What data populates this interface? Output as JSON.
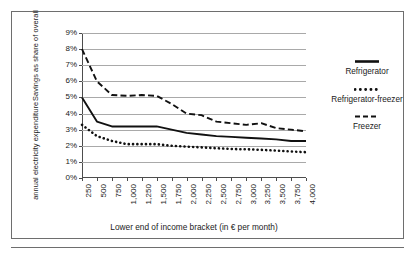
{
  "chart_data": {
    "type": "line",
    "title": "",
    "xlabel": "Lower end of income bracket (in € per month)",
    "ylabel": "Savings as share of overall annual electricity expenditure",
    "ylabel_lines": [
      "Savings as share of overall",
      "annual electricity expenditure"
    ],
    "categories": [
      "250",
      "500",
      "750",
      "1,000",
      "1,250",
      "1,500",
      "1,750",
      "2,000",
      "2,250",
      "2,500",
      "2,750",
      "3,000",
      "3,250",
      "3,500",
      "3,750",
      "4,000"
    ],
    "ytick_labels": [
      "0%",
      "1%",
      "2%",
      "3%",
      "4%",
      "5%",
      "6%",
      "7%",
      "8%",
      "9%"
    ],
    "ytick_values": [
      0,
      1,
      2,
      3,
      4,
      5,
      6,
      7,
      8,
      9
    ],
    "ylim": [
      0,
      9
    ],
    "grid": true,
    "legend_position": "right",
    "series": [
      {
        "name": "Refrigerator",
        "style": "solid",
        "color": "#111111",
        "values": [
          5.0,
          3.5,
          3.2,
          3.2,
          3.2,
          3.2,
          3.0,
          2.8,
          2.7,
          2.6,
          2.55,
          2.5,
          2.45,
          2.4,
          2.3,
          2.3
        ]
      },
      {
        "name": "Refrigerator-freezer",
        "style": "dotted",
        "color": "#111111",
        "values": [
          3.3,
          2.6,
          2.3,
          2.1,
          2.1,
          2.1,
          2.0,
          1.95,
          1.9,
          1.85,
          1.8,
          1.78,
          1.75,
          1.7,
          1.65,
          1.6
        ]
      },
      {
        "name": "Freezer",
        "style": "dashed",
        "color": "#111111",
        "values": [
          8.0,
          6.0,
          5.15,
          5.1,
          5.15,
          5.1,
          4.6,
          4.0,
          3.9,
          3.5,
          3.4,
          3.3,
          3.4,
          3.1,
          3.0,
          2.9
        ]
      }
    ]
  },
  "legend": {
    "entries": [
      {
        "label": "Refrigerator",
        "style": "solid"
      },
      {
        "label": "Refrigerator-freezer",
        "style": "dotted"
      },
      {
        "label": "Freezer",
        "style": "dashed"
      }
    ]
  }
}
